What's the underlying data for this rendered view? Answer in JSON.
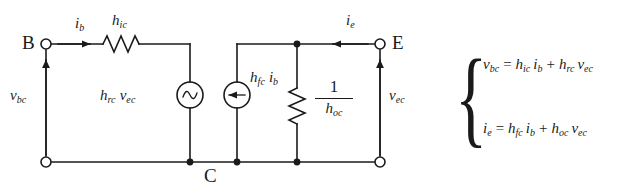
{
  "figure": {
    "type": "circuit-schematic",
    "background_color": "#ffffff",
    "line_color": "#1a1a1a"
  },
  "terminals": [
    {
      "id": "B",
      "label": "B",
      "marker": "open-circle",
      "x": 46,
      "y": 44
    },
    {
      "id": "E",
      "label": "E",
      "marker": "open-circle",
      "x": 380,
      "y": 44
    },
    {
      "id": "C",
      "label": "C",
      "marker": "rail-label",
      "x": 210,
      "y": 175
    }
  ],
  "nodes": [
    {
      "name": "bottom-left-terminal",
      "marker": "open-circle",
      "x": 46,
      "y": 162
    },
    {
      "name": "bottom-right-terminal",
      "marker": "open-circle",
      "x": 380,
      "y": 162
    },
    {
      "name": "junction-vsource-bottom",
      "marker": "filled-dot",
      "x": 190,
      "y": 162
    },
    {
      "name": "junction-isource-bottom",
      "marker": "filled-dot",
      "x": 237,
      "y": 162
    },
    {
      "name": "junction-resistor-bottom",
      "marker": "filled-dot",
      "x": 297,
      "y": 162
    },
    {
      "name": "junction-resistor-top",
      "marker": "filled-dot",
      "x": 297,
      "y": 44
    }
  ],
  "components": [
    {
      "id": "h-ic-resistor",
      "kind": "resistor",
      "orientation": "horizontal",
      "label": "h",
      "label_sub": "ic",
      "label_x": 118,
      "label_y": 16
    },
    {
      "id": "h-rc-vec-source",
      "kind": "voltage-source-ac",
      "orientation": "vertical",
      "label": "h",
      "label_sub": "rc",
      "label2": "v",
      "label2_sub": "ec",
      "label_x": 100,
      "label_y": 88,
      "center_x": 190,
      "center_y": 95,
      "radius": 13
    },
    {
      "id": "h-fc-ib-source",
      "kind": "current-source",
      "orientation": "vertical",
      "arrow_direction": "down",
      "label": "h",
      "label_sub": "fc",
      "label2": "i",
      "label2_sub": "b",
      "label_x": 248,
      "label_y": 75,
      "center_x": 237,
      "center_y": 95,
      "radius": 13
    },
    {
      "id": "h-oc-resistor",
      "kind": "resistor",
      "orientation": "vertical",
      "label_numerator": "1",
      "label_denominator": "h",
      "label_denominator_sub": "oc",
      "label_x": 315,
      "label_y": 82
    }
  ],
  "annotations": [
    {
      "id": "ib-current",
      "symbol": "i",
      "sub": "b",
      "arrow": "right",
      "label_x": 75,
      "label_y": 18,
      "arrow_x1": 56,
      "arrow_x2": 92,
      "arrow_y": 44
    },
    {
      "id": "ie-current",
      "symbol": "i",
      "sub": "e",
      "arrow": "left",
      "label_x": 346,
      "label_y": 15,
      "arrow_x1": 370,
      "arrow_x2": 330,
      "arrow_y": 44
    },
    {
      "id": "vbc-voltage",
      "symbol": "v",
      "sub": "bc",
      "arrow": "up",
      "label_x": 14,
      "label_y": 95,
      "arrow_x": 46,
      "arrow_y1": 155,
      "arrow_y2": 58
    },
    {
      "id": "vec-voltage",
      "symbol": "v",
      "sub": "ec",
      "arrow": "up",
      "label_x": 388,
      "label_y": 95,
      "arrow_x": 380,
      "arrow_y1": 155,
      "arrow_y2": 58
    }
  ],
  "equations": {
    "brace": "{",
    "lines": [
      {
        "id": "equation-vbc",
        "lhs": "v",
        "lhs_sub": "bc",
        "terms": [
          {
            "coef": "h",
            "coef_sub": "ic",
            "var": "i",
            "var_sub": "b"
          },
          {
            "coef": "h",
            "coef_sub": "rc",
            "var": "v",
            "var_sub": "ec"
          }
        ],
        "plain": "v_bc = h_ic i_b + h_rc v_ec"
      },
      {
        "id": "equation-ie",
        "lhs": "i",
        "lhs_sub": "e",
        "terms": [
          {
            "coef": "h",
            "coef_sub": "fc",
            "var": "i",
            "var_sub": "b"
          },
          {
            "coef": "h",
            "coef_sub": "oc",
            "var": "v",
            "var_sub": "ec"
          }
        ],
        "plain": "i_e = h_fc i_b + h_oc v_ec"
      }
    ]
  }
}
